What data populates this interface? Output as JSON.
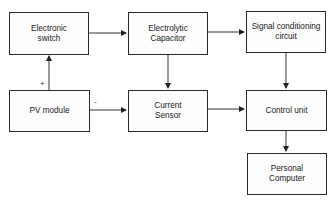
{
  "diagram": {
    "blocks": {
      "electronic_switch": "Electronic\nswitch",
      "electrolytic_capacitor": "Electrolytic\nCapacitor",
      "signal_conditioning": "Signal conditioning\ncircuit",
      "pv_module": "PV module",
      "current_sensor": "Current\nSensor",
      "control_unit": "Control unit",
      "personal_computer": "Personal\nComputer"
    },
    "labels": {
      "plus": "+",
      "minus": "-"
    },
    "connections": [
      {
        "from": "pv_module",
        "to": "electronic_switch",
        "label": "+"
      },
      {
        "from": "electronic_switch",
        "to": "electrolytic_capacitor"
      },
      {
        "from": "electrolytic_capacitor",
        "to": "signal_conditioning"
      },
      {
        "from": "electrolytic_capacitor",
        "to": "current_sensor"
      },
      {
        "from": "pv_module",
        "to": "current_sensor",
        "label": "-"
      },
      {
        "from": "signal_conditioning",
        "to": "control_unit"
      },
      {
        "from": "current_sensor",
        "to": "control_unit"
      },
      {
        "from": "control_unit",
        "to": "personal_computer"
      }
    ]
  }
}
